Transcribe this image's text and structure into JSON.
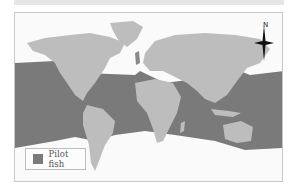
{
  "top_strip": {},
  "map": {
    "colors": {
      "land": "#bdbdbd",
      "range": "#7a7a7a",
      "ocean_outside": "#fafafa",
      "frame": "#c8c8c8"
    }
  },
  "compass": {
    "label": "N"
  },
  "legend": {
    "items": [
      {
        "label": "Pilot fish",
        "color": "#7a7a7a"
      }
    ]
  }
}
